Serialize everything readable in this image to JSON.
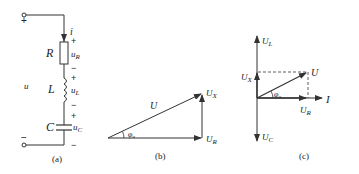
{
  "figure_a": {
    "caption": "(a)",
    "source_label": "u",
    "current_label": "i",
    "top_terminal_sign": "+",
    "bottom_terminal_sign": "−",
    "components": [
      {
        "name": "R",
        "voltage": "u",
        "voltage_sub": "R",
        "plus": "+",
        "minus": "−"
      },
      {
        "name": "L",
        "voltage": "u",
        "voltage_sub": "L",
        "plus": "+",
        "minus": "−"
      },
      {
        "name": "C",
        "voltage": "u",
        "voltage_sub": "C",
        "plus": "+",
        "minus": "−"
      }
    ]
  },
  "figure_b": {
    "caption": "(b)",
    "hyp_label": "U",
    "vert_label": "U",
    "vert_sub": "X",
    "horiz_label": "U",
    "horiz_sub": "R",
    "angle_label": "φ",
    "angle_sub": "u"
  },
  "figure_c": {
    "caption": "(c)",
    "ul_label": "U",
    "ul_sub": "L",
    "ux_label": "U",
    "ux_sub": "X",
    "uc_label": "U",
    "uc_sub": "C",
    "u_label": "U",
    "ur_label": "U",
    "ur_sub": "R",
    "i_label": "I",
    "angle_label": "φ",
    "angle_sub": "u"
  },
  "colors": {
    "line": "#333333",
    "background": "#ffffff"
  }
}
